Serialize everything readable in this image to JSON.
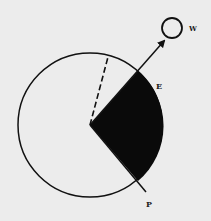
{
  "diagram": {
    "background": "#ececec",
    "stroke_color": "#111111",
    "fill_color": "#0a0a0a",
    "main_circle": {
      "cx": 90,
      "cy": 125,
      "r": 72
    },
    "shaded_sector": {
      "apex": [
        90,
        125
      ],
      "start": [
        138,
        71
      ],
      "end": [
        138,
        181
      ]
    },
    "arrow_line": {
      "from": [
        90,
        125
      ],
      "to": [
        164,
        41
      ]
    },
    "p_line": {
      "from": [
        90,
        125
      ],
      "to": [
        146,
        192
      ]
    },
    "dashed_line": {
      "from": [
        90,
        125
      ],
      "to": [
        108,
        57
      ]
    },
    "small_circle": {
      "cx": 172,
      "cy": 28,
      "r": 10
    },
    "labels": {
      "w": "W",
      "e": "E",
      "p": "P"
    }
  }
}
